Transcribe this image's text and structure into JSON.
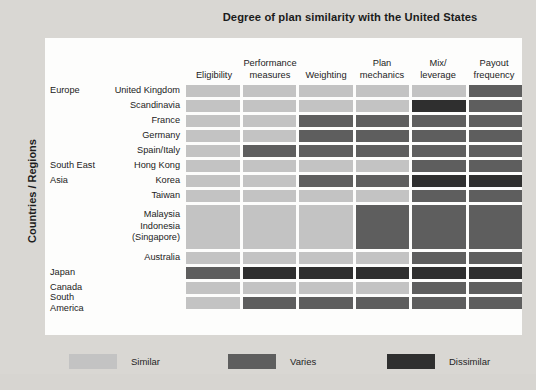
{
  "chart_data": {
    "type": "heatmap",
    "title": "Degree of plan similarity with the United States",
    "ylabel": "Countries / Regions",
    "xlabel": "",
    "grid": false,
    "legend_position": "bottom",
    "categories": [
      "Eligibility",
      "Performance measures",
      "Weighting",
      "Plan mechanics",
      "Mix/ leverage",
      "Payout frequency"
    ],
    "column_headers": [
      {
        "line1": "",
        "line2": "Eligibility"
      },
      {
        "line1": "Performance",
        "line2": "measures"
      },
      {
        "line1": "",
        "line2": "Weighting"
      },
      {
        "line1": "Plan",
        "line2": "mechanics"
      },
      {
        "line1": "Mix/",
        "line2": "leverage"
      },
      {
        "line1": "Payout",
        "line2": "frequency"
      }
    ],
    "scale": {
      "levels": [
        "Similar",
        "Varies",
        "Dissimilar"
      ],
      "colors": {
        "Similar": "#c3c3c3",
        "Varies": "#5e5e5e",
        "Dissimilar": "#2f2f2f"
      }
    },
    "legend": [
      {
        "label": "Similar",
        "color": "#c3c3c3"
      },
      {
        "label": "Varies",
        "color": "#5e5e5e"
      },
      {
        "label": "Dissimilar",
        "color": "#2f2f2f"
      }
    ],
    "rows": [
      {
        "region": "Europe",
        "country_lines": [
          "United Kingdom"
        ],
        "height": 15,
        "values": [
          "Similar",
          "Similar",
          "Similar",
          "Similar",
          "Similar",
          "Varies"
        ]
      },
      {
        "region": "",
        "country_lines": [
          "Scandinavia"
        ],
        "height": 15,
        "values": [
          "Similar",
          "Similar",
          "Similar",
          "Similar",
          "Dissimilar",
          "Varies"
        ]
      },
      {
        "region": "",
        "country_lines": [
          "France"
        ],
        "height": 15,
        "values": [
          "Similar",
          "Similar",
          "Varies",
          "Varies",
          "Varies",
          "Varies"
        ]
      },
      {
        "region": "",
        "country_lines": [
          "Germany"
        ],
        "height": 15,
        "values": [
          "Similar",
          "Similar",
          "Varies",
          "Varies",
          "Varies",
          "Varies"
        ]
      },
      {
        "region": "",
        "country_lines": [
          "Spain/Italy"
        ],
        "height": 15,
        "values": [
          "Similar",
          "Varies",
          "Varies",
          "Varies",
          "Varies",
          "Varies"
        ]
      },
      {
        "region": "South East",
        "country_lines": [
          "Hong Kong"
        ],
        "height": 15,
        "values": [
          "Similar",
          "Similar",
          "Similar",
          "Similar",
          "Varies",
          "Varies"
        ]
      },
      {
        "region": "Asia",
        "country_lines": [
          "Korea"
        ],
        "height": 15,
        "values": [
          "Similar",
          "Similar",
          "Varies",
          "Varies",
          "Dissimilar",
          "Dissimilar"
        ]
      },
      {
        "region": "",
        "country_lines": [
          "Taiwan"
        ],
        "height": 15,
        "values": [
          "Similar",
          "Similar",
          "Similar",
          "Similar",
          "Varies",
          "Varies"
        ]
      },
      {
        "region": "",
        "country_lines": [
          "Malaysia",
          "Indonesia",
          "(Singapore)"
        ],
        "height": 47,
        "values": [
          "Similar",
          "Similar",
          "Similar",
          "Varies",
          "Varies",
          "Varies"
        ]
      },
      {
        "region": "",
        "country_lines": [
          "Australia"
        ],
        "height": 15,
        "values": [
          "Similar",
          "Similar",
          "Similar",
          "Similar",
          "Varies",
          "Varies"
        ]
      },
      {
        "region": "Japan",
        "country_lines": [],
        "height": 15,
        "values": [
          "Varies",
          "Dissimilar",
          "Dissimilar",
          "Dissimilar",
          "Dissimilar",
          "Dissimilar"
        ]
      },
      {
        "region": "Canada",
        "country_lines": [],
        "height": 15,
        "values": [
          "Similar",
          "Similar",
          "Similar",
          "Similar",
          "Varies",
          "Varies"
        ]
      },
      {
        "region": "South America",
        "country_lines": [],
        "height": 15,
        "values": [
          "Similar",
          "Varies",
          "Varies",
          "Varies",
          "Varies",
          "Varies"
        ]
      }
    ]
  }
}
